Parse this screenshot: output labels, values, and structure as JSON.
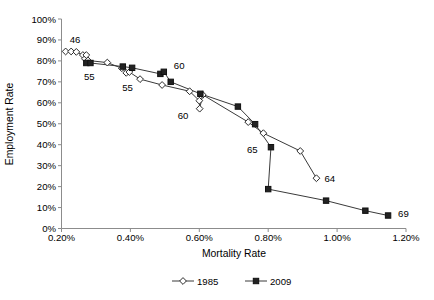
{
  "top_caption": "",
  "bottom_caption": "",
  "chart_data": {
    "type": "scatter",
    "title": "",
    "xlabel": "Mortality Rate",
    "ylabel": "Employment Rate",
    "xlim": [
      0.2,
      1.2
    ],
    "ylim": [
      0,
      100
    ],
    "x_ticks": [
      "0.20%",
      "0.40%",
      "0.60%",
      "0.80%",
      "1.00%",
      "1.20%"
    ],
    "x_tick_values": [
      0.2,
      0.4,
      0.6,
      0.8,
      1.0,
      1.2
    ],
    "y_ticks": [
      "0%",
      "10%",
      "20%",
      "30%",
      "40%",
      "50%",
      "60%",
      "70%",
      "80%",
      "90%",
      "100%"
    ],
    "y_tick_values": [
      0,
      10,
      20,
      30,
      40,
      50,
      60,
      70,
      80,
      90,
      100
    ],
    "grid": false,
    "legend_position": "bottom",
    "series": [
      {
        "name": "1985",
        "marker": "open-diamond",
        "points": [
          {
            "x": 0.212,
            "y": 84.5
          },
          {
            "x": 0.228,
            "y": 84.5
          },
          {
            "x": 0.243,
            "y": 84.3
          },
          {
            "x": 0.262,
            "y": 82.8
          },
          {
            "x": 0.268,
            "y": 81.0
          },
          {
            "x": 0.272,
            "y": 82.8
          },
          {
            "x": 0.277,
            "y": 80.2
          },
          {
            "x": 0.333,
            "y": 79.2
          },
          {
            "x": 0.375,
            "y": 76.5
          },
          {
            "x": 0.388,
            "y": 74.3
          },
          {
            "x": 0.397,
            "y": 74.7
          },
          {
            "x": 0.428,
            "y": 71.3
          },
          {
            "x": 0.492,
            "y": 68.5
          },
          {
            "x": 0.572,
            "y": 65.5
          },
          {
            "x": 0.6,
            "y": 61.0
          },
          {
            "x": 0.601,
            "y": 57.2
          },
          {
            "x": 0.61,
            "y": 63.8
          },
          {
            "x": 0.742,
            "y": 50.8
          },
          {
            "x": 0.786,
            "y": 45.5
          },
          {
            "x": 0.893,
            "y": 37.0
          },
          {
            "x": 0.94,
            "y": 24.0
          }
        ],
        "annotations": [
          {
            "label": "46",
            "x": 0.212,
            "y": 84.5,
            "dx": 4,
            "dy": -8
          },
          {
            "label": "55",
            "x": 0.277,
            "y": 80.2,
            "dx": -4,
            "dy": 20
          },
          {
            "label": "55",
            "x": 0.388,
            "y": 74.3,
            "dx": -4,
            "dy": 18
          },
          {
            "label": "60",
            "x": 0.601,
            "y": 57.2,
            "dx": -22,
            "dy": 10
          },
          {
            "label": "64",
            "x": 0.94,
            "y": 24.0,
            "dx": 8,
            "dy": 4
          }
        ]
      },
      {
        "name": "2009",
        "marker": "filled-square",
        "points": [
          {
            "x": 0.272,
            "y": 79.0
          },
          {
            "x": 0.284,
            "y": 79.0
          },
          {
            "x": 0.378,
            "y": 77.3
          },
          {
            "x": 0.405,
            "y": 76.7
          },
          {
            "x": 0.487,
            "y": 73.8
          },
          {
            "x": 0.497,
            "y": 74.8
          },
          {
            "x": 0.517,
            "y": 70.0
          },
          {
            "x": 0.603,
            "y": 64.3
          },
          {
            "x": 0.712,
            "y": 58.2
          },
          {
            "x": 0.762,
            "y": 49.8
          },
          {
            "x": 0.808,
            "y": 38.8
          },
          {
            "x": 0.8,
            "y": 18.8
          },
          {
            "x": 0.968,
            "y": 13.3
          },
          {
            "x": 1.082,
            "y": 8.5
          },
          {
            "x": 1.148,
            "y": 6.2
          }
        ],
        "annotations": [
          {
            "label": "60",
            "x": 0.497,
            "y": 74.8,
            "dx": 10,
            "dy": -3
          },
          {
            "label": "65",
            "x": 0.808,
            "y": 38.8,
            "dx": -24,
            "dy": 6
          },
          {
            "label": "69",
            "x": 1.148,
            "y": 6.2,
            "dx": 10,
            "dy": 1
          }
        ]
      }
    ]
  },
  "legend": {
    "items": [
      {
        "label": "1985",
        "marker": "open-diamond"
      },
      {
        "label": "2009",
        "marker": "filled-square"
      }
    ]
  }
}
